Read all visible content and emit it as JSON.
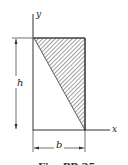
{
  "figure": {
    "axes": {
      "x_label": "x",
      "y_label": "y"
    },
    "dimensions": {
      "height_label": "h",
      "width_label": "b"
    },
    "caption": "Fig. PP-35",
    "colors": {
      "line": "#333333",
      "hatch": "#444444",
      "background": "#ffffff"
    }
  }
}
